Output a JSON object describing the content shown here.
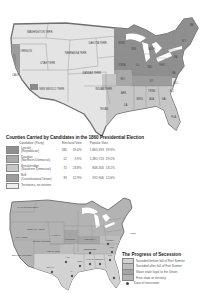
{
  "colors": {
    "lincoln": "#8f8f8f",
    "douglas": "#a8a8a8",
    "breckinridge": "#c6c6c6",
    "bell": "#9c9c9c",
    "territory": "#e4e4e4",
    "seceded_before": "#d2d2d2",
    "seceded_after": "#bdbdbd",
    "slave_loyal": "#a5a5a5",
    "free_state": "#b3b3b3",
    "land_outline": "#777777"
  },
  "map1": {
    "labels": {
      "washington": "WASHINGTON TERR.",
      "oregon": "OREGON",
      "california": "CALIF.",
      "utah": "UTAH TERR.",
      "nebraska": "NEBRASKA TERR.",
      "dakota": "DAKOTA TERR.",
      "kansas": "KANSAS TERR.",
      "new_mexico": "NEW MEXICO TERR.",
      "indian": "INDIAN TERR.",
      "texas": "TEXAS",
      "minnesota": "MINN.",
      "iowa": "IOWA",
      "wisconsin": "WIS.",
      "illinois": "ILL.",
      "missouri": "MO.",
      "arkansas": "ARK.",
      "louisiana": "LA.",
      "michigan": "MICH.",
      "indiana": "IND.",
      "ohio": "OHIO",
      "kentucky": "KY.",
      "tennessee": "TENN.",
      "mississippi": "MISS.",
      "alabama": "ALA.",
      "georgia": "GA.",
      "florida": "FLA.",
      "south_carolina": "S.C.",
      "north_carolina": "N.C.",
      "virginia": "VA.",
      "pennsylvania": "PA.",
      "new_york": "N.Y.",
      "maine": "ME."
    }
  },
  "table": {
    "title": "Counties Carried by Candidates in the 1860 Presidential Election",
    "headers": {
      "candidate": "Candidate (Party)",
      "electoral": "Electoral Vote",
      "popular": "Popular Vote"
    },
    "rows": [
      {
        "name": "Lincoln",
        "party": "(Republican)",
        "ev": "180",
        "ev_pct": "59.4%",
        "pv": "1,865,593",
        "pv_pct": "39.9%"
      },
      {
        "name": "Douglas",
        "party": "(Northern Democrat)",
        "ev": "12",
        "ev_pct": "3.9%",
        "pv": "1,382,713",
        "pv_pct": "29.5%"
      },
      {
        "name": "Breckinridge",
        "party": "(Southern Democrat)",
        "ev": "72",
        "ev_pct": "23.8%",
        "pv": "848,356",
        "pv_pct": "18.1%"
      },
      {
        "name": "Bell",
        "party": "(Constitutional Union)",
        "ev": "39",
        "ev_pct": "12.9%",
        "pv": "592,906",
        "pv_pct": "12.6%"
      },
      {
        "name": "Territories, no returns",
        "party": "",
        "ev": "",
        "ev_pct": "",
        "pv": "",
        "pv_pct": ""
      }
    ]
  },
  "map2": {
    "labels": {
      "washington": "WASHINGTON TERR.",
      "nebraska": "NEBRASKA TERR.",
      "utah": "UTAH TERR.",
      "colorado": "COLORADO TERR.",
      "kansas": "KANSAS",
      "new_mexico": "NEW MEXICO TERR.",
      "indian": "INDIAN TERR.",
      "texas": "TEXAS",
      "missouri": "MISSOURI",
      "kentucky": "KENTUCKY",
      "tennessee": "TENNESSEE",
      "arkansas": "ARK.",
      "louisiana": "LA.",
      "mississippi": "MISS.",
      "alabama": "ALABAMA",
      "georgia": "GEORGIA",
      "south_carolina": "S.C.",
      "north_carolina": "N.C.",
      "virginia": "VIRGINIA",
      "washington_dc": "Washington, D.C."
    }
  },
  "legend": {
    "title": "The Progress of Secession",
    "items": [
      "Seceded before fall of Fort Sumter",
      "Seceded after fall of Fort Sumter",
      "Slave state loyal to the Union",
      "Free state or territory",
      "Date of secession"
    ]
  }
}
